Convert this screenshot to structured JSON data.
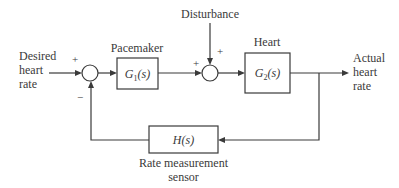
{
  "diagram": {
    "type": "feedback-control-block-diagram",
    "input": {
      "lines": [
        "Desired",
        "heart",
        "rate"
      ]
    },
    "output": {
      "lines": [
        "Actual",
        "heart",
        "rate"
      ]
    },
    "disturbance": {
      "label": "Disturbance"
    },
    "blocks": [
      {
        "id": "pacemaker",
        "title": "Pacemaker",
        "tf_main": "G",
        "tf_sub": "1",
        "tf_arg": "(s)"
      },
      {
        "id": "heart",
        "title": "Heart",
        "tf_main": "G",
        "tf_sub": "2",
        "tf_arg": "(s)"
      },
      {
        "id": "sensor",
        "tf_main": "H(s)",
        "caption_lines": [
          "Rate measurement",
          "sensor"
        ]
      }
    ],
    "summing_junctions": [
      {
        "id": "sum1",
        "signs": {
          "input": "+",
          "feedback": "−"
        }
      },
      {
        "id": "sum2",
        "signs": {
          "forward": "+",
          "disturbance": "+"
        }
      }
    ],
    "edges": [
      {
        "from": "input",
        "to": "sum1"
      },
      {
        "from": "sum1",
        "to": "pacemaker"
      },
      {
        "from": "pacemaker",
        "to": "sum2"
      },
      {
        "from": "disturbance",
        "to": "sum2"
      },
      {
        "from": "sum2",
        "to": "heart"
      },
      {
        "from": "heart",
        "to": "output"
      },
      {
        "from": "output",
        "to": "sensor"
      },
      {
        "from": "sensor",
        "to": "sum1"
      }
    ]
  }
}
